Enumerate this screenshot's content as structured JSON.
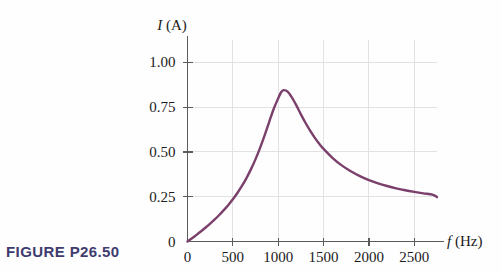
{
  "figure": {
    "caption": "FIGURE P26.50",
    "caption_color": "#3e3c6e"
  },
  "chart_data": {
    "type": "line",
    "title": "",
    "subtitle": "",
    "xlabel_symbol": "f",
    "xlabel_unit": "(Hz)",
    "ylabel_symbol": "I",
    "ylabel_unit": "(A)",
    "xlabel": "f (Hz)",
    "ylabel": "I (A)",
    "xlim": [
      0,
      2750
    ],
    "ylim": [
      0,
      1.125
    ],
    "xticks": [
      0,
      500,
      1000,
      1500,
      2000,
      2500
    ],
    "xtick_labels": [
      "0",
      "500",
      "1000",
      "1500",
      "2000",
      "2500"
    ],
    "yticks": [
      0,
      0.25,
      0.5,
      0.75,
      1.0
    ],
    "ytick_labels": [
      "0",
      "0.25",
      "0.50",
      "0.75",
      "1.00"
    ],
    "grid": true,
    "grid_color": "#e2e2e4",
    "legend": null,
    "series": [
      {
        "name": "current-vs-frequency",
        "color": "#7a3f6b",
        "x": [
          0,
          50,
          100,
          150,
          200,
          250,
          300,
          350,
          400,
          450,
          500,
          550,
          600,
          650,
          700,
          750,
          800,
          850,
          900,
          950,
          1000,
          1030,
          1060,
          1100,
          1150,
          1200,
          1250,
          1300,
          1350,
          1400,
          1450,
          1500,
          1600,
          1700,
          1800,
          1900,
          2000,
          2100,
          2200,
          2300,
          2400,
          2500,
          2600,
          2700,
          2750
        ],
        "y": [
          0.0,
          0.018,
          0.037,
          0.057,
          0.078,
          0.1,
          0.123,
          0.148,
          0.175,
          0.204,
          0.236,
          0.271,
          0.31,
          0.354,
          0.404,
          0.46,
          0.523,
          0.593,
          0.667,
          0.74,
          0.8,
          0.832,
          0.845,
          0.838,
          0.805,
          0.76,
          0.71,
          0.663,
          0.62,
          0.581,
          0.547,
          0.517,
          0.466,
          0.425,
          0.392,
          0.365,
          0.343,
          0.325,
          0.31,
          0.297,
          0.286,
          0.277,
          0.269,
          0.262,
          0.248
        ]
      }
    ],
    "annotations": {
      "peak_frequency": 1060,
      "peak_current": 0.845,
      "asymptote_current": 0.25
    }
  }
}
